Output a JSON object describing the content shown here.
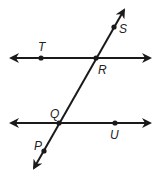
{
  "diagram": {
    "type": "parallel-lines-transversal",
    "stroke_color": "#1a1a1a",
    "lines": [
      {
        "id": "line-TR",
        "x1": 11,
        "y1": 58,
        "x2": 150,
        "y2": 58,
        "arrows": "both"
      },
      {
        "id": "line-QU",
        "x1": 11,
        "y1": 123,
        "x2": 150,
        "y2": 123,
        "arrows": "both"
      },
      {
        "id": "transversal-PS",
        "x1": 34,
        "y1": 168,
        "x2": 124,
        "y2": 10,
        "arrows": "both"
      }
    ],
    "points": [
      {
        "name": "T",
        "x": 41,
        "y": 58,
        "dot": true
      },
      {
        "name": "R",
        "x": 96,
        "y": 58,
        "dot": true
      },
      {
        "name": "S",
        "x": 114,
        "y": 27,
        "dot": true
      },
      {
        "name": "Q",
        "x": 59,
        "y": 123,
        "dot": true
      },
      {
        "name": "U",
        "x": 115,
        "y": 123,
        "dot": true
      },
      {
        "name": "P",
        "x": 44,
        "y": 151,
        "dot": true
      }
    ],
    "labels": {
      "T": {
        "text": "T",
        "x": 38,
        "y": 51
      },
      "R": {
        "text": "R",
        "x": 98,
        "y": 74
      },
      "S": {
        "text": "S",
        "x": 119,
        "y": 33
      },
      "Q": {
        "text": "Q",
        "x": 50,
        "y": 118
      },
      "U": {
        "text": "U",
        "x": 110,
        "y": 139
      },
      "P": {
        "text": "P",
        "x": 34,
        "y": 150
      }
    }
  }
}
